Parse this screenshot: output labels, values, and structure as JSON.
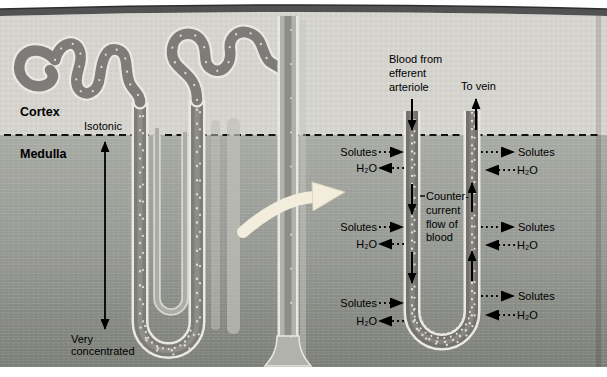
{
  "figure": {
    "regions": {
      "cortex_label": "Cortex",
      "medulla_label": "Medulla",
      "isotonic_label": "Isotonic",
      "very_concentrated_lines": [
        "Very",
        "concentrated"
      ]
    },
    "right_panel": {
      "blood_from_lines": [
        "Blood from",
        "efferent",
        "arteriole"
      ],
      "to_vein_label": "To vein",
      "countercurrent_lines": [
        "Counter-",
        "current",
        "flow of",
        "blood"
      ],
      "exchange_rows": [
        {
          "side": "descending-limb",
          "solutes": "Solutes",
          "water": "H₂O"
        },
        {
          "side": "descending-limb",
          "solutes": "Solutes",
          "water": "H₂O"
        },
        {
          "side": "descending-limb",
          "solutes": "Solutes",
          "water": "H₂O"
        },
        {
          "side": "ascending-limb",
          "solutes": "Solutes",
          "water": "H₂O"
        },
        {
          "side": "ascending-limb",
          "solutes": "Solutes",
          "water": "H₂O"
        },
        {
          "side": "ascending-limb",
          "solutes": "Solutes",
          "water": "H₂O"
        }
      ]
    },
    "colors": {
      "capsule_band": "#525252",
      "cortex": "#d5d4cf",
      "medulla_top": "#a8aaa4",
      "medulla_bottom": "#7c7e78",
      "tube_outline": "#eae8e2",
      "tube_fill": "#74726e",
      "duct_fill": "#b2b2ac",
      "magnify_arrow": "#f2eddc",
      "text": "#000000"
    }
  }
}
